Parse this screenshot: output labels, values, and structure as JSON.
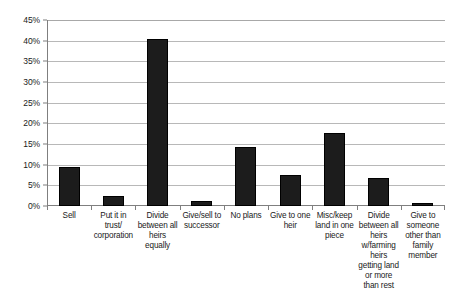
{
  "chart_data": {
    "type": "bar",
    "title": "",
    "xlabel": "",
    "ylabel": "",
    "ylim": [
      0,
      45
    ],
    "grid": true,
    "legend": "none",
    "orientation": "vertical",
    "bar_color": "#1c1c1c",
    "axis_color": "#7f7f7f",
    "gridline_color": "#b8b8b8",
    "y_tick_labels": [
      "45%",
      "40%",
      "35%",
      "30%",
      "25%",
      "20%",
      "15%",
      "10%",
      "5%",
      "0%"
    ],
    "y_tick_values": [
      45,
      40,
      35,
      30,
      25,
      20,
      15,
      10,
      5,
      0
    ],
    "categories": [
      "Sell",
      "Put it in trust/ corporation",
      "Divide between all heirs equally",
      "Give/sell to successor",
      "No plans",
      "Give to one heir",
      "Misc/keep land in one piece",
      "Divide between all heirs w/farming heirs getting land or more than rest",
      "Give to someone other than family member"
    ],
    "values": [
      9.5,
      2.5,
      40.3,
      1.2,
      14.3,
      7.4,
      17.6,
      6.8,
      0.8
    ],
    "bars": [
      {
        "label": "Sell",
        "value": 9.5
      },
      {
        "label": "Put it in trust/ corporation",
        "value": 2.5
      },
      {
        "label": "Divide between all heirs equally",
        "value": 40.3
      },
      {
        "label": "Give/sell to successor",
        "value": 1.2
      },
      {
        "label": "No plans",
        "value": 14.3
      },
      {
        "label": "Give to one heir",
        "value": 7.4
      },
      {
        "label": "Misc/keep land in one piece",
        "value": 17.6
      },
      {
        "label": "Divide between all heirs w/farming heirs getting land or more than rest",
        "value": 6.8
      },
      {
        "label": "Give to someone other than family member",
        "value": 0.8
      }
    ]
  }
}
